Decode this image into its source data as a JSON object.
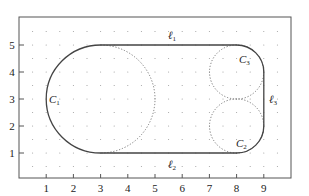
{
  "figure": {
    "x_ticks": [
      "1",
      "2",
      "3",
      "4",
      "5",
      "6",
      "7",
      "8",
      "9"
    ],
    "y_ticks": [
      "1",
      "2",
      "3",
      "4",
      "5"
    ],
    "x_range": [
      0,
      10
    ],
    "y_range": [
      0,
      6.3
    ],
    "grid": "dotted points every 0.5 units",
    "colors": {
      "solid": "#444444",
      "dotted": "#777777",
      "axis": "#555555",
      "grid_dot": "#9a9a9a"
    }
  },
  "labels": {
    "l1": {
      "main": "ℓ",
      "sub": "1"
    },
    "l2": {
      "main": "ℓ",
      "sub": "2"
    },
    "l3": {
      "main": "ℓ",
      "sub": "3"
    },
    "c1": {
      "main": "C",
      "sub": "1"
    },
    "c2": {
      "main": "C",
      "sub": "2"
    },
    "c3": {
      "main": "C",
      "sub": "3"
    }
  },
  "shapes": {
    "C1": {
      "center": [
        3,
        3
      ],
      "radius": 2,
      "solid_arc": "left half (x ≤ 3)",
      "dotted_arc": "right half"
    },
    "C2": {
      "center": [
        8,
        2
      ],
      "radius": 1,
      "solid_arc": "lower-right quarter",
      "dotted_arc": "remainder"
    },
    "C3": {
      "center": [
        8,
        4
      ],
      "radius": 1,
      "solid_arc": "upper-right quarter",
      "dotted_arc": "remainder"
    },
    "l1": {
      "from": [
        3,
        5
      ],
      "to": [
        8,
        5
      ]
    },
    "l2": {
      "from": [
        3,
        1
      ],
      "to": [
        8,
        1
      ]
    },
    "l3": {
      "from": [
        9,
        2
      ],
      "to": [
        9,
        4
      ]
    }
  }
}
